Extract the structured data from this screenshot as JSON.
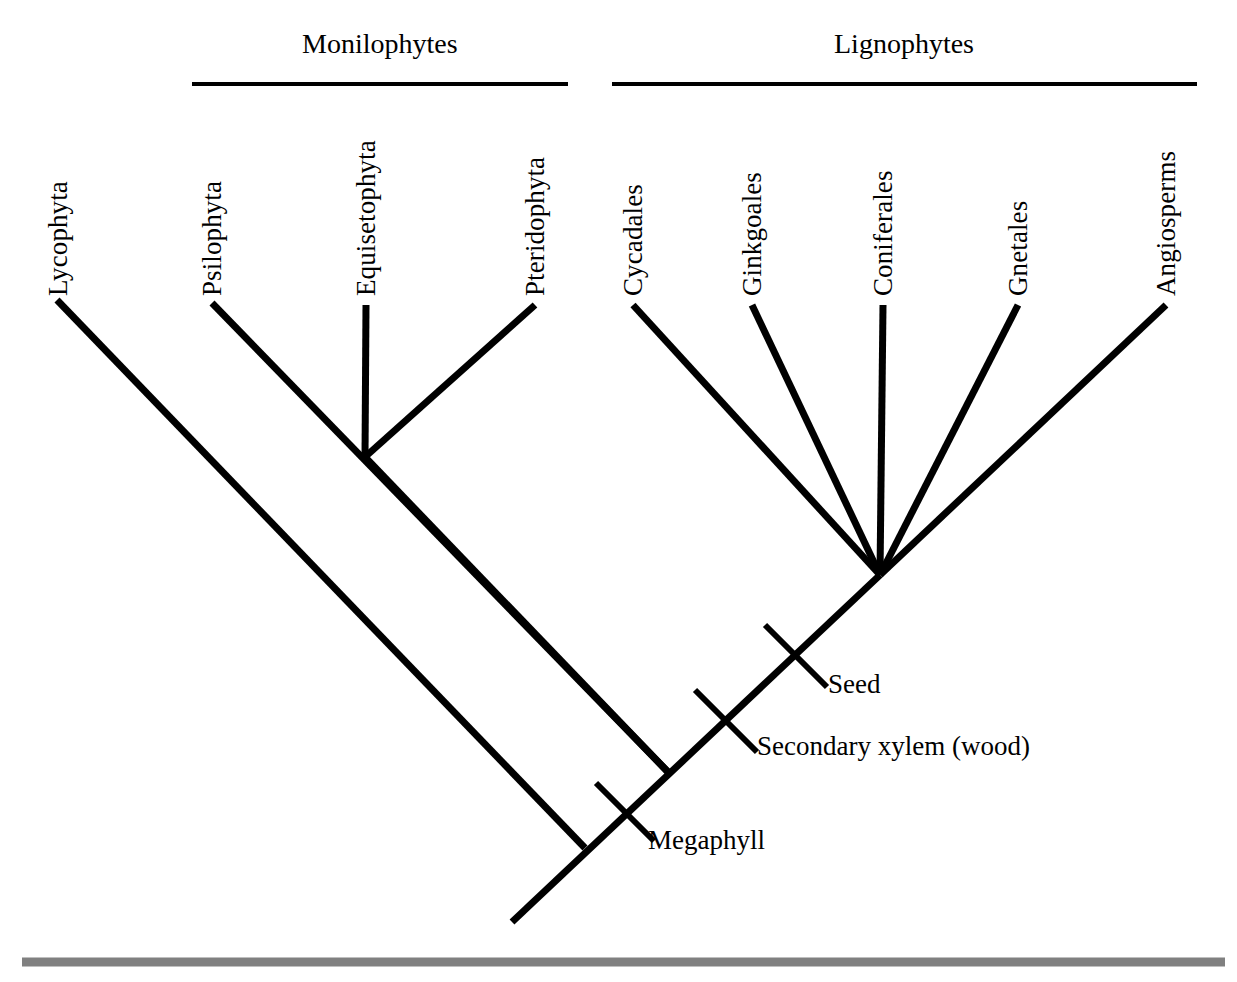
{
  "figure": {
    "type": "cladogram",
    "background_color": "#ffffff",
    "line_color": "#000000",
    "footer_rule_color": "#808080"
  },
  "clades": [
    {
      "name": "monilophytes",
      "label": "Monilophytes",
      "bracket": {
        "x1": 192,
        "x2": 568,
        "y": 84
      },
      "title_center_x": 380,
      "title_y": 30
    },
    {
      "name": "lignophytes",
      "label": "Lignophytes",
      "bracket": {
        "x1": 612,
        "x2": 1197,
        "y": 84
      },
      "title_center_x": 904,
      "title_y": 30
    }
  ],
  "taxa": [
    {
      "key": "lycophyta",
      "label": "Lycophyta",
      "label_x": 72,
      "label_y": 296,
      "tip_x": 57,
      "tip_y": 300
    },
    {
      "key": "psilophyta",
      "label": "Psilophyta",
      "label_x": 226,
      "label_y": 296,
      "tip_x": 212,
      "tip_y": 303
    },
    {
      "key": "equisetophyta",
      "label": "Equisetophyta",
      "label_x": 380,
      "label_y": 296,
      "tip_x": 366,
      "tip_y": 305
    },
    {
      "key": "pteridophyta",
      "label": "Pteridophyta",
      "label_x": 549,
      "label_y": 296,
      "tip_x": 535,
      "tip_y": 305
    },
    {
      "key": "cycadales",
      "label": "Cycadales",
      "label_x": 647,
      "label_y": 296,
      "tip_x": 633,
      "tip_y": 305
    },
    {
      "key": "ginkgoales",
      "label": "Ginkgoales",
      "label_x": 766,
      "label_y": 296,
      "tip_x": 752,
      "tip_y": 305
    },
    {
      "key": "coniferales",
      "label": "Coniferales",
      "label_x": 897,
      "label_y": 296,
      "tip_x": 883,
      "tip_y": 305
    },
    {
      "key": "gnetales",
      "label": "Gnetales",
      "label_x": 1032,
      "label_y": 296,
      "tip_x": 1018,
      "tip_y": 305
    },
    {
      "key": "angiosperms",
      "label": "Angiosperms",
      "label_x": 1180,
      "label_y": 296,
      "tip_x": 1166,
      "tip_y": 305
    }
  ],
  "nodes": [
    {
      "key": "monilophyte-node",
      "x": 365,
      "y": 457
    },
    {
      "key": "seed-plant-node",
      "x": 880,
      "y": 575
    },
    {
      "key": "lignophyte-node",
      "x": 668,
      "y": 772
    },
    {
      "key": "root-node",
      "x": 585,
      "y": 848
    },
    {
      "key": "root-base",
      "x": 512,
      "y": 922
    }
  ],
  "branches": [
    {
      "key": "branch-lycophyta",
      "x1": 57,
      "y1": 300,
      "x2": 585,
      "y2": 848
    },
    {
      "key": "branch-psilophyta",
      "x1": 212,
      "y1": 303,
      "x2": 668,
      "y2": 772
    },
    {
      "key": "branch-equisetophyta",
      "x1": 366,
      "y1": 305,
      "x2": 365,
      "y2": 457
    },
    {
      "key": "branch-pteridophyta",
      "x1": 535,
      "y1": 305,
      "x2": 365,
      "y2": 457
    },
    {
      "key": "branch-monilophyte-stem",
      "x1": 365,
      "y1": 457,
      "x2": 668,
      "y2": 772
    },
    {
      "key": "branch-cycadales",
      "x1": 633,
      "y1": 305,
      "x2": 880,
      "y2": 575
    },
    {
      "key": "branch-ginkgoales",
      "x1": 752,
      "y1": 305,
      "x2": 880,
      "y2": 575
    },
    {
      "key": "branch-coniferales",
      "x1": 883,
      "y1": 305,
      "x2": 880,
      "y2": 575
    },
    {
      "key": "branch-gnetales",
      "x1": 1018,
      "y1": 305,
      "x2": 880,
      "y2": 575
    },
    {
      "key": "branch-angiosperms",
      "x1": 1166,
      "y1": 305,
      "x2": 880,
      "y2": 575
    },
    {
      "key": "branch-backbone",
      "x1": 880,
      "y1": 575,
      "x2": 512,
      "y2": 922
    }
  ],
  "traits": [
    {
      "key": "seed",
      "label": "Seed",
      "hash": {
        "x1": 765,
        "y1": 625,
        "x2": 827,
        "y2": 687
      },
      "label_x": 828,
      "label_y": 671
    },
    {
      "key": "secondary-xylem",
      "label": "Secondary xylem (wood)",
      "hash": {
        "x1": 695,
        "y1": 690,
        "x2": 757,
        "y2": 752
      },
      "label_x": 757,
      "label_y": 733
    },
    {
      "key": "megaphyll",
      "label": "Megaphyll",
      "hash": {
        "x1": 596,
        "y1": 783,
        "x2": 654,
        "y2": 841
      },
      "label_x": 648,
      "label_y": 827
    }
  ],
  "footer_rule": {
    "x1": 22,
    "x2": 1225,
    "y": 962,
    "thickness": 9
  }
}
